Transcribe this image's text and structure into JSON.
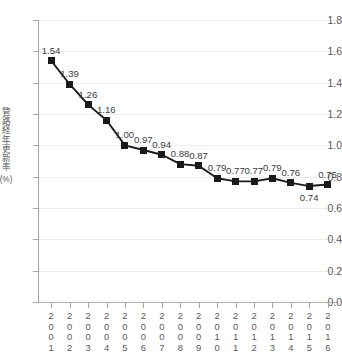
{
  "axis": {
    "y_title_chars": [
      "管",
      "路",
      "経",
      "年",
      "更",
      "新",
      "率"
    ],
    "y_unit": "(%)",
    "y_ticks": [
      "1.8",
      "1.6",
      "1.4",
      "1.2",
      "1.0",
      "0.8",
      "0.6",
      "0.4",
      "0.2",
      "0.0"
    ],
    "x_labels": [
      "2001",
      "2002",
      "2003",
      "2004",
      "2005",
      "2006",
      "2007",
      "2008",
      "2009",
      "2010",
      "2011",
      "2012",
      "2013",
      "2014",
      "2015",
      "2016"
    ]
  },
  "chart_data": {
    "type": "line",
    "title": "",
    "xlabel": "",
    "ylabel": "管路経年更新率 (%)",
    "ylim": [
      0.0,
      1.8
    ],
    "ystep": 0.2,
    "grid": true,
    "legend": "none",
    "marker": "square",
    "line_color": "#1a1a1a",
    "marker_color": "#1a1a1a",
    "grid_color": "#ececec",
    "axis_color": "#a6a6a6",
    "categories": [
      "2001",
      "2002",
      "2003",
      "2004",
      "2005",
      "2006",
      "2007",
      "2008",
      "2009",
      "2010",
      "2011",
      "2012",
      "2013",
      "2014",
      "2015",
      "2016"
    ],
    "values": [
      1.54,
      1.39,
      1.26,
      1.16,
      1.0,
      0.97,
      0.94,
      0.88,
      0.87,
      0.79,
      0.77,
      0.77,
      0.79,
      0.76,
      0.74,
      0.75
    ],
    "data_labels": [
      "1.54",
      "1.39",
      "1.26",
      "1.16",
      "1.00",
      "0.97",
      "0.94",
      "0.88",
      "0.87",
      "0.79",
      "0.77",
      "0.77",
      "0.79",
      "0.76",
      "0.74",
      "0.75"
    ],
    "data_label_positions": [
      "above",
      "above",
      "above",
      "above",
      "above",
      "above",
      "above",
      "above",
      "above",
      "above",
      "above",
      "above",
      "above",
      "above",
      "below",
      "above"
    ]
  }
}
